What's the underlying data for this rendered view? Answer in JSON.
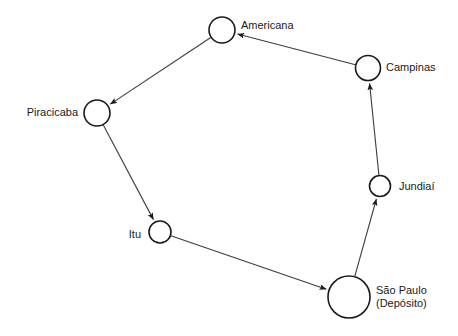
{
  "diagram": {
    "type": "directed-cycle-route",
    "stroke_color": "#3c3c3c",
    "node_stroke_color": "#1a1a1a",
    "node_fill_color": "#ffffff",
    "label_color": "#1a1a1a",
    "background_color": "#ffffff"
  },
  "nodes": [
    {
      "id": "americana",
      "label": "Americana",
      "label_lines": [
        "Americana"
      ],
      "cx": 222,
      "cy": 30,
      "r": 13,
      "label_x": 241,
      "label_y": 26,
      "anchor": "start",
      "is_depot": false
    },
    {
      "id": "campinas",
      "label": "Campinas",
      "label_lines": [
        "Campinas"
      ],
      "cx": 368,
      "cy": 68,
      "r": 12.5,
      "label_x": 386,
      "label_y": 68,
      "anchor": "start",
      "is_depot": false
    },
    {
      "id": "jundiai",
      "label": "Jundiaí",
      "label_lines": [
        "Jundiaí"
      ],
      "cx": 380,
      "cy": 186,
      "r": 10.5,
      "label_x": 399,
      "label_y": 187,
      "anchor": "start",
      "is_depot": false
    },
    {
      "id": "sao-paulo",
      "label": "São Paulo (Depósito)",
      "label_lines": [
        "São Paulo",
        "(Depósito)"
      ],
      "cx": 349,
      "cy": 297,
      "r": 21,
      "label_x": 376,
      "label_y": 291,
      "anchor": "start",
      "is_depot": true
    },
    {
      "id": "itu",
      "label": "Itu",
      "label_lines": [
        "Itu"
      ],
      "cx": 160,
      "cy": 232,
      "r": 11,
      "label_x": 141,
      "label_y": 235,
      "anchor": "end",
      "is_depot": false
    },
    {
      "id": "piracicaba",
      "label": "Piracicaba",
      "label_lines": [
        "Piracicaba"
      ],
      "cx": 97,
      "cy": 113,
      "r": 13,
      "label_x": 78,
      "label_y": 113,
      "anchor": "end",
      "is_depot": false
    }
  ],
  "edges": [
    {
      "id": "sao-paulo-to-jundiai",
      "from": "sao-paulo",
      "to": "jundiai",
      "arrow": true
    },
    {
      "id": "jundiai-to-campinas",
      "from": "jundiai",
      "to": "campinas",
      "arrow": true
    },
    {
      "id": "campinas-to-americana",
      "from": "campinas",
      "to": "americana",
      "arrow": true
    },
    {
      "id": "americana-to-piracicaba",
      "from": "americana",
      "to": "piracicaba",
      "arrow": true
    },
    {
      "id": "piracicaba-to-itu",
      "from": "piracicaba",
      "to": "itu",
      "arrow": true
    },
    {
      "id": "itu-to-sao-paulo",
      "from": "itu",
      "to": "sao-paulo",
      "arrow": true
    }
  ]
}
